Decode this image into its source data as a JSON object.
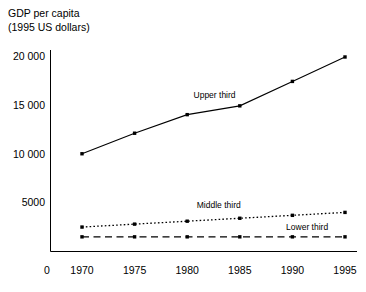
{
  "chart_data": {
    "type": "line",
    "title_line1": "GDP per capita",
    "title_line2": "(1995 US dollars)",
    "xlabel": "",
    "ylabel": "GDP per capita (1995 US dollars)",
    "x": [
      1970,
      1975,
      1980,
      1985,
      1990,
      1995
    ],
    "categories": [
      "1970",
      "1975",
      "1980",
      "1985",
      "1990",
      "1995"
    ],
    "xtick_labels": [
      "1970",
      "1975",
      "1980",
      "1985",
      "1990",
      "1995"
    ],
    "ytick_labels": [
      "0",
      "5000",
      "10 000",
      "15 000",
      "20 000"
    ],
    "ytick_values": [
      0,
      5000,
      10000,
      15000,
      20000
    ],
    "ylim": [
      0,
      21500
    ],
    "xlim": [
      1968.2,
      1996.8
    ],
    "grid": false,
    "legend_position": "inline-annotations",
    "origin_label": "0",
    "series": [
      {
        "name": "Upper third",
        "label": "Upper third",
        "style": "solid",
        "color": "#000000",
        "values": [
          10000,
          12100,
          14000,
          14900,
          17400,
          19900
        ]
      },
      {
        "name": "Middle third",
        "label": "Middle third",
        "style": "dotted",
        "color": "#000000",
        "values": [
          2500,
          2800,
          3100,
          3400,
          3700,
          4000
        ]
      },
      {
        "name": "Lower third",
        "label": "Lower third",
        "style": "dashed",
        "color": "#000000",
        "values": [
          1500,
          1500,
          1500,
          1500,
          1500,
          1500
        ]
      }
    ],
    "annotations": [
      {
        "text": "Upper third",
        "x": 1982.6,
        "y": 15700
      },
      {
        "text": "Middle third",
        "x": 1983.0,
        "y": 4450
      },
      {
        "text": "Lower third",
        "x": 1991.4,
        "y": 2250
      }
    ]
  }
}
